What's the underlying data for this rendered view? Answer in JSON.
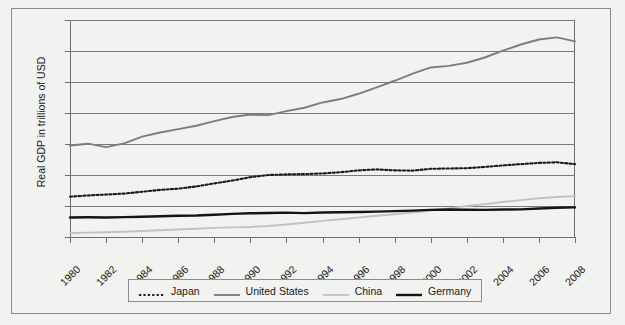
{
  "chart_data": {
    "type": "line",
    "title": "",
    "xlabel": "",
    "ylabel": "Real GDP in trillions of USD",
    "ylim": [
      0,
      14
    ],
    "ytick_labels": [
      "0",
      "2",
      "4",
      "6",
      "8",
      "10",
      "12",
      "14"
    ],
    "ytick_values": [
      0,
      2,
      4,
      6,
      8,
      10,
      12,
      14
    ],
    "grid": true,
    "legend_position": "bottom",
    "x": [
      1980,
      1981,
      1982,
      1983,
      1984,
      1985,
      1986,
      1987,
      1988,
      1989,
      1990,
      1991,
      1992,
      1993,
      1994,
      1995,
      1996,
      1997,
      1998,
      1999,
      2000,
      2001,
      2002,
      2003,
      2004,
      2005,
      2006,
      2007,
      2008
    ],
    "xtick_labels": [
      "1980",
      "1982",
      "1984",
      "1986",
      "1988",
      "1990",
      "1992",
      "1994",
      "1996",
      "1998",
      "2000",
      "2002",
      "2004",
      "2006",
      "2008"
    ],
    "xtick_values": [
      1980,
      1982,
      1984,
      1986,
      1988,
      1990,
      1992,
      1994,
      1996,
      1998,
      2000,
      2002,
      2004,
      2006,
      2008
    ],
    "xlim": [
      1980,
      2008
    ],
    "series": [
      {
        "name": "Japan",
        "style": "dotted",
        "color": "#1a1a1a",
        "width": 2.1,
        "values": [
          2.6,
          2.68,
          2.74,
          2.8,
          2.92,
          3.04,
          3.12,
          3.26,
          3.46,
          3.64,
          3.86,
          4.0,
          4.04,
          4.06,
          4.1,
          4.18,
          4.3,
          4.36,
          4.3,
          4.28,
          4.4,
          4.42,
          4.44,
          4.52,
          4.62,
          4.7,
          4.78,
          4.82,
          4.7
        ]
      },
      {
        "name": "United States",
        "style": "solid",
        "color": "#7d7d7d",
        "width": 1.9,
        "values": [
          5.9,
          6.02,
          5.8,
          6.04,
          6.48,
          6.74,
          6.96,
          7.18,
          7.48,
          7.74,
          7.9,
          7.86,
          8.12,
          8.34,
          8.68,
          8.9,
          9.24,
          9.66,
          10.08,
          10.54,
          10.94,
          11.04,
          11.24,
          11.58,
          12.02,
          12.42,
          12.74,
          12.88,
          12.62
        ]
      },
      {
        "name": "China",
        "style": "solid",
        "color": "#c2c2c2",
        "width": 1.9,
        "values": [
          0.26,
          0.28,
          0.31,
          0.34,
          0.39,
          0.44,
          0.48,
          0.53,
          0.59,
          0.62,
          0.65,
          0.71,
          0.81,
          0.92,
          1.04,
          1.15,
          1.26,
          1.37,
          1.47,
          1.58,
          1.71,
          1.85,
          2.0,
          2.12,
          2.26,
          2.38,
          2.5,
          2.58,
          2.64
        ]
      },
      {
        "name": "Germany",
        "style": "solid",
        "color": "#141414",
        "width": 2.4,
        "values": [
          1.26,
          1.27,
          1.26,
          1.28,
          1.31,
          1.34,
          1.37,
          1.39,
          1.44,
          1.49,
          1.53,
          1.55,
          1.57,
          1.54,
          1.58,
          1.6,
          1.61,
          1.64,
          1.67,
          1.7,
          1.75,
          1.77,
          1.76,
          1.75,
          1.77,
          1.78,
          1.84,
          1.89,
          1.91
        ]
      }
    ]
  },
  "legend": {
    "entries": [
      {
        "label": "Japan"
      },
      {
        "label": "United States"
      },
      {
        "label": "China"
      },
      {
        "label": "Germany"
      }
    ]
  }
}
